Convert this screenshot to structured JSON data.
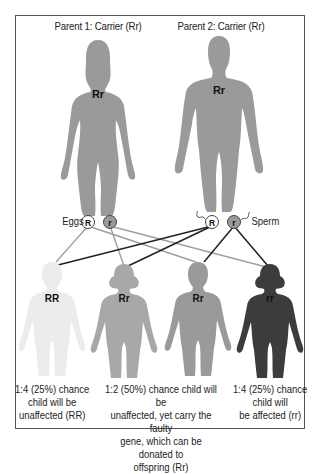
{
  "parents": [
    {
      "title": "Parent 1: Carrier (Rr)",
      "genotype": "Rr",
      "sex": "female",
      "color": "#9a9a9a"
    },
    {
      "title": "Parent 2: Carrier (Rr)",
      "genotype": "Rr",
      "sex": "male",
      "color": "#9a9a9a"
    }
  ],
  "gametes": {
    "eggs_label": "Eggs",
    "sperm_label": "Sperm",
    "eggs": [
      {
        "allele": "R",
        "fill": "#ffffff"
      },
      {
        "allele": "r",
        "fill": "#9a9a9a"
      }
    ],
    "sperm": [
      {
        "allele": "R",
        "fill": "#ffffff"
      },
      {
        "allele": "r",
        "fill": "#9a9a9a"
      }
    ]
  },
  "children": [
    {
      "genotype": "RR",
      "color": "#ececec",
      "sex": "boy"
    },
    {
      "genotype": "Rr",
      "color": "#a8a8a8",
      "sex": "girl"
    },
    {
      "genotype": "Rr",
      "color": "#9a9a9a",
      "sex": "boy"
    },
    {
      "genotype": "rr",
      "color": "#3c3c3c",
      "sex": "girl"
    }
  ],
  "captions": [
    "1:4 (25%) chance\nchild will be\nunaffected (RR)",
    "1:2 (50%) chance child will be\nunaffected, yet carry the faulty\ngene, which can be donated to\noffspring (Rr)",
    "1:4 (25%) chance\nchild will\nbe affected (rr)"
  ],
  "line_colors": {
    "maternal": "#a0a0a0",
    "paternal": "#222222"
  }
}
